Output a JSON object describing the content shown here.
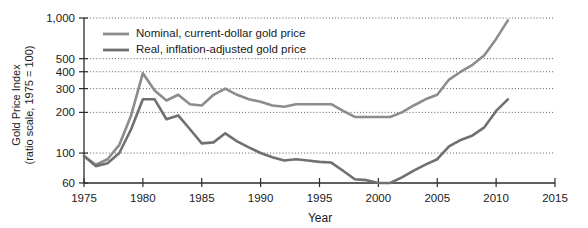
{
  "chart_data": {
    "type": "line",
    "title": "",
    "xlabel": "Year",
    "ylabel": "Gold Price Index (ratio scale, 1975 = 100)",
    "ylabel_line1": "Gold Price Index",
    "ylabel_line2": "(ratio scale, 1975 = 100)",
    "yscale": "log",
    "ylim": [
      60,
      1000
    ],
    "xlim": [
      1975,
      2015
    ],
    "grid": true,
    "grid_axis": "y",
    "legend_position": "top-left-inside",
    "ytick_labels": [
      "1,000",
      "500",
      "400",
      "300",
      "200",
      "100",
      "60"
    ],
    "ytick_values": [
      1000,
      500,
      400,
      300,
      200,
      100,
      60
    ],
    "xtick_labels": [
      "1975",
      "1980",
      "1985",
      "1990",
      "1995",
      "2000",
      "2005",
      "2010",
      "2015"
    ],
    "xtick_values": [
      1975,
      1980,
      1985,
      1990,
      1995,
      2000,
      2005,
      2010,
      2015
    ],
    "series": [
      {
        "name": "Nominal, current-dollar gold price",
        "color": "#8c8c8c",
        "x": [
          1975,
          1976,
          1977,
          1978,
          1979,
          1980,
          1981,
          1982,
          1983,
          1984,
          1985,
          1986,
          1987,
          1988,
          1989,
          1990,
          1991,
          1992,
          1993,
          1994,
          1995,
          1996,
          1997,
          1998,
          1999,
          2000,
          2001,
          2002,
          2003,
          2004,
          2005,
          2006,
          2007,
          2008,
          2009,
          2010,
          2011
        ],
        "values": [
          95,
          82,
          90,
          115,
          190,
          390,
          290,
          245,
          270,
          230,
          225,
          270,
          300,
          270,
          250,
          240,
          225,
          220,
          230,
          230,
          230,
          230,
          205,
          185,
          185,
          185,
          185,
          200,
          225,
          250,
          270,
          350,
          400,
          450,
          530,
          700,
          960
        ]
      },
      {
        "name": "Real, inflation-adjusted gold price",
        "color": "#707070",
        "x": [
          1975,
          1976,
          1977,
          1978,
          1979,
          1980,
          1981,
          1982,
          1983,
          1984,
          1985,
          1986,
          1987,
          1988,
          1989,
          1990,
          1991,
          1992,
          1993,
          1994,
          1995,
          1996,
          1997,
          1998,
          1999,
          2000,
          2001,
          2002,
          2003,
          2004,
          2005,
          2006,
          2007,
          2008,
          2009,
          2010,
          2011
        ],
        "values": [
          95,
          80,
          84,
          100,
          150,
          250,
          250,
          178,
          190,
          150,
          118,
          120,
          140,
          122,
          110,
          100,
          93,
          88,
          90,
          88,
          86,
          85,
          74,
          64,
          63,
          60,
          60,
          66,
          74,
          82,
          90,
          112,
          125,
          135,
          155,
          205,
          250
        ]
      }
    ],
    "legend": [
      {
        "label": "Nominal, current-dollar gold price",
        "color": "#8c8c8c"
      },
      {
        "label": "Real, inflation-adjusted gold price",
        "color": "#707070"
      }
    ]
  }
}
